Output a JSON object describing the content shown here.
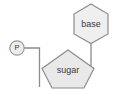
{
  "diagram": {
    "background_color": "#ffffff",
    "shape_fill": "#e9e9e9",
    "shape_stroke": "#8c8c8c",
    "connector_color": "#8c8c8c",
    "label_color": "#3a3a3a",
    "nodes": {
      "base": {
        "label": "base",
        "shape": "hexagon",
        "center_x": 91,
        "center_y": 24
      },
      "sugar": {
        "label": "sugar",
        "shape": "pentagon",
        "center_x": 68,
        "center_y": 69
      },
      "phosphate": {
        "label": "P",
        "shape": "circle",
        "center_x": 17,
        "center_y": 48
      }
    },
    "connectors": [
      {
        "name": "phosphate-to-sugar",
        "from": "phosphate",
        "to": "sugar"
      },
      {
        "name": "base-to-sugar",
        "from": "base",
        "to": "sugar"
      }
    ]
  }
}
